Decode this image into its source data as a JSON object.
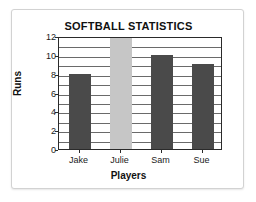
{
  "chart_data": {
    "type": "bar",
    "title": "SOFTBALL STATISTICS",
    "xlabel": "Players",
    "ylabel": "Runs",
    "categories": [
      "Jake",
      "Julie",
      "Sam",
      "Sue"
    ],
    "values": [
      8,
      12,
      10,
      9
    ],
    "ylim": [
      0,
      12
    ],
    "ytick_labels": [
      "0",
      "2",
      "4",
      "6",
      "8",
      "10",
      "12"
    ],
    "ytick_values": [
      0,
      2,
      4,
      6,
      8,
      10,
      12
    ],
    "gridline_interval": 1,
    "grid": true,
    "legend": "none",
    "bar_colors": [
      "#4a4a4a",
      "#c6c6c6",
      "#4a4a4a",
      "#4a4a4a"
    ],
    "series": [
      {
        "name": "Runs",
        "values": [
          8,
          12,
          10,
          9
        ]
      }
    ]
  },
  "colors": {
    "bar_dark": "#4a4a4a",
    "bar_light": "#c6c6c6",
    "frame": "#2a2a2a",
    "grid": "#6a6a6a",
    "card_border": "#d2d2d2",
    "background": "#ffffff",
    "text": "#111111"
  }
}
